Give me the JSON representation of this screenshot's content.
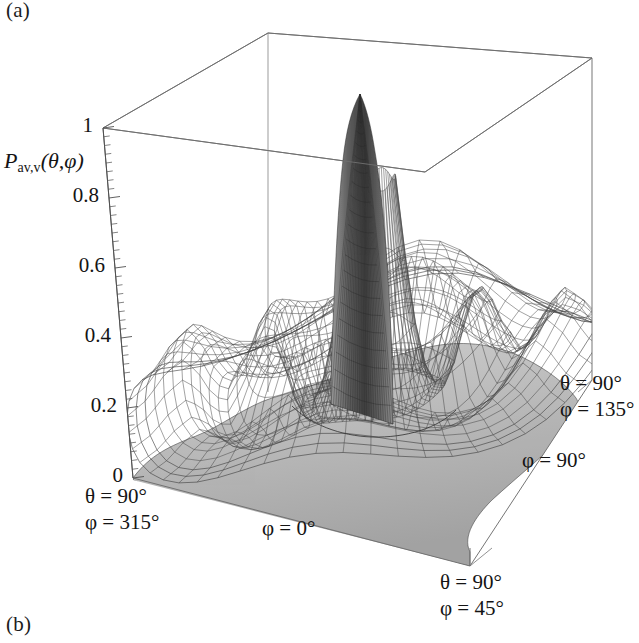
{
  "figure": {
    "panel_a_label": "(a)",
    "panel_b_label": "(b)"
  },
  "axis": {
    "z_title_main": "P",
    "z_title_sub": "av,v",
    "z_title_args": "(θ,φ)"
  },
  "chart_data": {
    "type": "surface",
    "title": "",
    "zlabel": "P_av,v(θ,φ)",
    "xlabel": "",
    "ylabel": "",
    "zlim": [
      0,
      1
    ],
    "zticks": [
      "0",
      "0.2",
      "0.4",
      "0.6",
      "0.8",
      "1"
    ],
    "ztick_values": [
      0,
      0.2,
      0.4,
      0.6,
      0.8,
      1
    ],
    "grid": false,
    "legend": "none",
    "style": "wireframe-mesh-grayscale",
    "projection": "axonometric",
    "corner_annotations": [
      {
        "id": "front-left",
        "theta": "θ = 90°",
        "phi": "φ = 315°"
      },
      {
        "id": "front",
        "theta": "",
        "phi": "φ = 0°"
      },
      {
        "id": "front-right",
        "theta": "θ = 90°",
        "phi": "φ = 45°"
      },
      {
        "id": "right",
        "theta": "",
        "phi": "φ = 90°"
      },
      {
        "id": "rear-right",
        "theta": "θ = 90°",
        "phi": "φ = 135°"
      }
    ],
    "peak_value": 1.0,
    "radial_profile_r": [
      0.0,
      0.03,
      0.06,
      0.09,
      0.12,
      0.15,
      0.18,
      0.21,
      0.24,
      0.28,
      0.32,
      0.36,
      0.4,
      0.45,
      0.5,
      0.55,
      0.6,
      0.66,
      0.72,
      0.78,
      0.85,
      0.92,
      1.0
    ],
    "radial_profile_z": [
      1.0,
      0.96,
      0.86,
      0.7,
      0.52,
      0.36,
      0.24,
      0.16,
      0.11,
      0.09,
      0.14,
      0.24,
      0.33,
      0.35,
      0.28,
      0.18,
      0.13,
      0.16,
      0.22,
      0.25,
      0.22,
      0.17,
      0.14
    ]
  },
  "ticks": [
    {
      "label": "1",
      "value": 1.0
    },
    {
      "label": "0.8",
      "value": 0.8
    },
    {
      "label": "0.6",
      "value": 0.6
    },
    {
      "label": "0.4",
      "value": 0.4
    },
    {
      "label": "0.2",
      "value": 0.2
    },
    {
      "label": "0",
      "value": 0.0
    }
  ],
  "annotations": {
    "front_left_theta": "θ = 90°",
    "front_left_phi": "φ = 315°",
    "front_phi": "φ = 0°",
    "front_right_theta": "θ = 90°",
    "front_right_phi": "φ = 45°",
    "right_phi": "φ = 90°",
    "rear_right_theta": "θ = 90°",
    "rear_right_phi": "φ = 135°"
  },
  "colors": {
    "background": "#ffffff",
    "box_line": "#6e6e6e",
    "axis_line": "#5a5a5a",
    "mesh_line": "#3c3c3c",
    "surface_fill": "#b9b9b9",
    "peak_fill": "#7d7d7d",
    "text": "#141414"
  }
}
